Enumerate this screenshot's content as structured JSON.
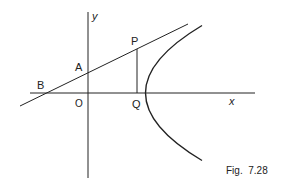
{
  "figure": {
    "caption": "Fig.  7.28",
    "axes": {
      "x_label": "x",
      "y_label": "y"
    },
    "points": {
      "P": "P",
      "A": "A",
      "B": "B",
      "O": "O",
      "Q": "Q"
    },
    "elements": [
      "parabola y^2 = 4ax",
      "tangent at P meeting y-axis at A and x-axis at B",
      "ordinate PQ"
    ]
  }
}
